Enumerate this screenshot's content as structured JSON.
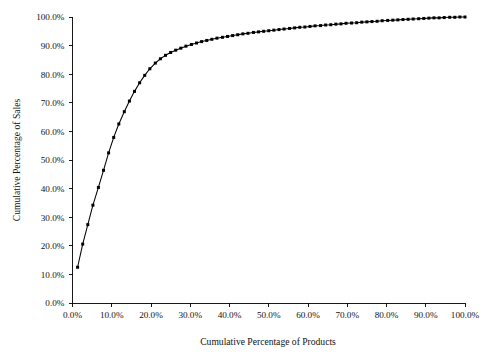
{
  "chart_data": {
    "type": "line",
    "title": "",
    "xlabel": "Cumulative Percentage of Products",
    "ylabel": "Cumulative Percentage of Sales",
    "xlim": [
      0,
      100
    ],
    "ylim": [
      0,
      100
    ],
    "grid": false,
    "legend": "none",
    "marker": "filled-square",
    "marker_color": "#000000",
    "line_color": "#000000",
    "background_color": "#ffffff",
    "x_tick_labels": [
      "0.0%",
      "10.0%",
      "20.0%",
      "30.0%",
      "40.0%",
      "50.0%",
      "60.0%",
      "70.0%",
      "80.0%",
      "90.0%",
      "100.0%"
    ],
    "x_tick_values": [
      0,
      10,
      20,
      30,
      40,
      50,
      60,
      70,
      80,
      90,
      100
    ],
    "y_tick_labels": [
      "0.0%",
      "10.0%",
      "20.0%",
      "30.0%",
      "40.0%",
      "50.0%",
      "60.0%",
      "70.0%",
      "80.0%",
      "90.0%",
      "100.0%"
    ],
    "y_tick_values": [
      0,
      10,
      20,
      30,
      40,
      50,
      60,
      70,
      80,
      90,
      100
    ],
    "series": [
      {
        "name": "Cumulative sales vs products",
        "x": [
          1.3,
          2.6,
          3.9,
          5.2,
          6.6,
          7.9,
          9.2,
          10.5,
          11.8,
          13.2,
          14.5,
          15.8,
          17.1,
          18.4,
          19.7,
          21.1,
          22.4,
          23.7,
          25.0,
          26.3,
          27.6,
          28.9,
          30.3,
          31.6,
          32.9,
          34.2,
          35.5,
          36.8,
          38.2,
          39.5,
          40.8,
          42.1,
          43.4,
          44.7,
          46.1,
          47.4,
          48.7,
          50.0,
          51.3,
          52.6,
          53.9,
          55.3,
          56.6,
          57.9,
          59.2,
          60.5,
          61.8,
          63.2,
          64.5,
          65.8,
          67.1,
          68.4,
          69.7,
          71.1,
          72.4,
          73.7,
          75.0,
          76.3,
          77.6,
          78.9,
          80.3,
          81.6,
          82.9,
          84.2,
          85.5,
          86.8,
          88.2,
          89.5,
          90.8,
          92.1,
          93.4,
          94.7,
          96.1,
          97.4,
          98.7,
          100.0
        ],
        "y": [
          12.5,
          20.6,
          27.4,
          34.2,
          40.4,
          46.4,
          52.5,
          57.9,
          62.6,
          66.9,
          70.6,
          74.0,
          77.0,
          79.6,
          81.9,
          83.9,
          85.4,
          86.6,
          87.6,
          88.4,
          89.1,
          89.8,
          90.4,
          90.9,
          91.4,
          91.8,
          92.2,
          92.6,
          92.9,
          93.2,
          93.5,
          93.8,
          94.1,
          94.3,
          94.6,
          94.8,
          95.0,
          95.2,
          95.4,
          95.6,
          95.8,
          96.0,
          96.2,
          96.4,
          96.5,
          96.7,
          96.9,
          97.0,
          97.2,
          97.3,
          97.5,
          97.6,
          97.8,
          97.9,
          98.0,
          98.2,
          98.3,
          98.4,
          98.5,
          98.7,
          98.8,
          98.9,
          99.0,
          99.1,
          99.2,
          99.3,
          99.4,
          99.5,
          99.6,
          99.7,
          99.7,
          99.8,
          99.9,
          99.9,
          100.0,
          100.0
        ]
      }
    ]
  }
}
